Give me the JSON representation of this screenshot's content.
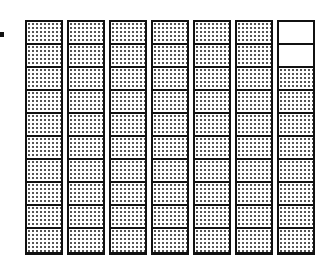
{
  "figure": {
    "columns": 7,
    "rows_per_column": 10,
    "shaded_total": 68,
    "total_cells": 70,
    "shaded_color": "#555555",
    "empty_cells": [
      {
        "column": 7,
        "row": 1
      },
      {
        "column": 7,
        "row": 2
      }
    ]
  }
}
